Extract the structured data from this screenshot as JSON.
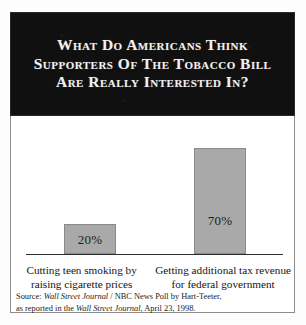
{
  "title": {
    "line1": "What Do Americans Think",
    "line2": "Supporters Of The Tobacco Bill",
    "line3": "Are Really Interested In?"
  },
  "chart_data": {
    "type": "bar",
    "title": "What Do Americans Think Supporters Of The Tobacco Bill Are Really Interested In?",
    "categories": [
      "Cutting teen smoking by raising cigarette prices",
      "Getting additional tax revenue for federal government"
    ],
    "values": [
      20,
      70
    ],
    "value_labels": [
      "20%",
      "70%"
    ],
    "xlabel": "",
    "ylabel": "",
    "ylim": [
      0,
      80
    ],
    "grid": false,
    "legend": false,
    "bar_color": "#a9a9a9",
    "bar_border_color": "#8a8a8a",
    "background_color": "#ffffff",
    "title_background_color": "#111010",
    "title_text_color": "#f2f0ee"
  },
  "categories": [
    {
      "line1": "Cutting teen smoking by",
      "line2": "raising cigarette prices",
      "value_label": "20%"
    },
    {
      "line1": "Getting additional tax revenue",
      "line2": "for federal government",
      "value_label": "70%"
    }
  ],
  "source": {
    "line1_prefix": "Source: ",
    "line1_italic": "Wall Street Journal",
    "line1_suffix": " / NBC News Poll by Hart-Teeter,",
    "line2_prefix": "as reported in the ",
    "line2_italic": "Wall Street Journal",
    "line2_suffix": ", April 23, 1998."
  }
}
